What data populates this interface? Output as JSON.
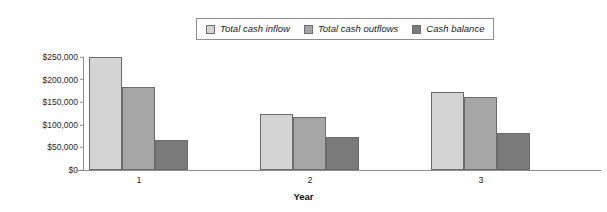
{
  "chart_data": {
    "type": "bar",
    "title": "",
    "xlabel": "Year",
    "ylabel": "",
    "categories": [
      "1",
      "2",
      "3"
    ],
    "series": [
      {
        "name": "Total cash inflow",
        "color": "#d4d4d4",
        "values": [
          250000,
          124000,
          172000
        ]
      },
      {
        "name": "Total cash outflows",
        "color": "#a6a6a6",
        "values": [
          183000,
          118000,
          161000
        ]
      },
      {
        "name": "Cash balance",
        "color": "#7a7a7a",
        "values": [
          67000,
          72000,
          82000
        ]
      }
    ],
    "ylim": [
      0,
      250000
    ],
    "ytick_labels": [
      "$250,000",
      "$200,000",
      "$150,000",
      "$100,000",
      "$50,000",
      "$0"
    ],
    "ytick_values": [
      250000,
      200000,
      150000,
      100000,
      50000,
      0
    ],
    "grid": false,
    "legend_position": "top-center"
  },
  "legend": {
    "items": [
      {
        "label": "Total cash inflow"
      },
      {
        "label": "Total cash outflows"
      },
      {
        "label": "Cash balance"
      }
    ]
  },
  "yaxis": {
    "ticks": [
      {
        "label": "$250,000"
      },
      {
        "label": "$200,000"
      },
      {
        "label": "$150,000"
      },
      {
        "label": "$100,000"
      },
      {
        "label": "$50,000"
      },
      {
        "label": "$0"
      }
    ]
  },
  "xaxis": {
    "title": "Year",
    "ticks": [
      {
        "label": "1"
      },
      {
        "label": "2"
      },
      {
        "label": "3"
      }
    ]
  }
}
